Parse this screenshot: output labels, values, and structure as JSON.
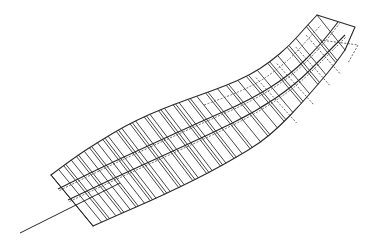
{
  "diagram": {
    "title": "",
    "colors": {
      "background": "#ffffff",
      "line": "#2a2a2a"
    },
    "outline": {
      "top_edge": [
        [
          51,
          175
        ],
        [
          75,
          157
        ],
        [
          100,
          141
        ],
        [
          125,
          126
        ],
        [
          150,
          114
        ],
        [
          175,
          104
        ],
        [
          200,
          95
        ],
        [
          225,
          86
        ],
        [
          250,
          75
        ],
        [
          270,
          62
        ],
        [
          290,
          45
        ],
        [
          305,
          28
        ],
        [
          317,
          15
        ]
      ],
      "bottom_edge": [
        [
          93,
          226
        ],
        [
          120,
          214
        ],
        [
          150,
          201
        ],
        [
          180,
          187
        ],
        [
          210,
          172
        ],
        [
          235,
          158
        ],
        [
          260,
          143
        ],
        [
          280,
          126
        ],
        [
          300,
          105
        ],
        [
          320,
          82
        ],
        [
          335,
          64
        ],
        [
          345,
          50
        ]
      ],
      "tip_edge": [
        [
          317,
          15
        ],
        [
          355,
          27
        ],
        [
          345,
          50
        ]
      ],
      "dashed_tip": [
        [
          320,
          40
        ],
        [
          358,
          45
        ],
        [
          348,
          63
        ]
      ]
    },
    "spines": [
      {
        "points": [
          [
            58,
            189
          ],
          [
            100,
            168
          ],
          [
            150,
            145
          ],
          [
            200,
            122
          ],
          [
            250,
            100
          ],
          [
            290,
            75
          ],
          [
            320,
            45
          ],
          [
            338,
            22
          ]
        ]
      },
      {
        "points": [
          [
            68,
            200
          ],
          [
            110,
            180
          ],
          [
            160,
            157
          ],
          [
            210,
            134
          ],
          [
            255,
            112
          ],
          [
            295,
            85
          ],
          [
            325,
            55
          ],
          [
            345,
            35
          ]
        ]
      }
    ],
    "tail_line": {
      "from": [
        20,
        233
      ],
      "to": [
        120,
        183
      ]
    },
    "rib_count": 34,
    "rib_params": [
      0.0,
      0.03,
      0.05,
      0.08,
      0.1,
      0.13,
      0.15,
      0.18,
      0.2,
      0.22,
      0.25,
      0.27,
      0.3,
      0.32,
      0.35,
      0.37,
      0.4,
      0.42,
      0.45,
      0.47,
      0.5,
      0.53,
      0.56,
      0.6,
      0.63,
      0.67,
      0.7,
      0.74,
      0.78,
      0.82,
      0.86,
      0.9,
      0.95,
      1.0
    ],
    "dashed_ribs": [
      0.72,
      0.8,
      0.88,
      0.93
    ]
  }
}
